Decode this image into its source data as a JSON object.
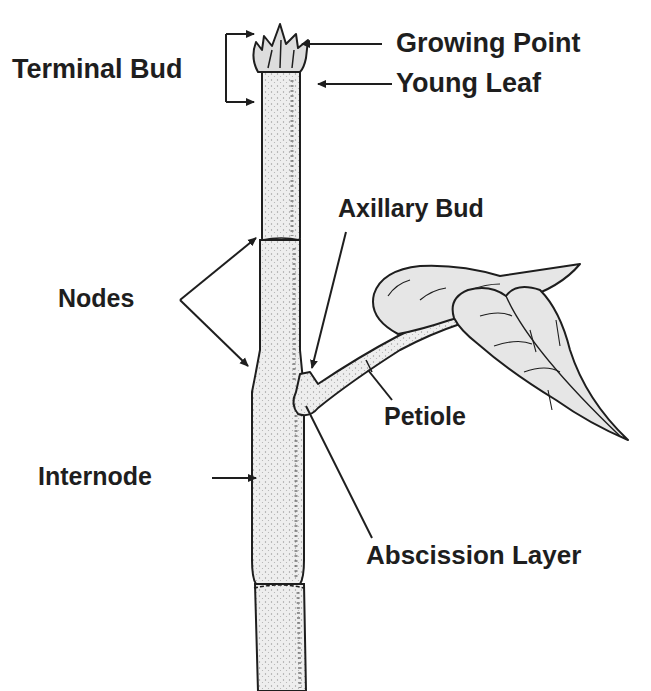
{
  "diagram": {
    "type": "botanical-illustration",
    "labels": {
      "terminal_bud": "Terminal Bud",
      "growing_point": "Growing Point",
      "young_leaf": "Young Leaf",
      "axillary_bud": "Axillary Bud",
      "nodes": "Nodes",
      "petiole": "Petiole",
      "internode": "Internode",
      "abscission_layer": "Abscission Layer"
    },
    "colors": {
      "ink": "#1e1e1e",
      "stem_fill": "#ececec",
      "leaf_fill": "#e6e6e6",
      "background": "#ffffff"
    }
  }
}
